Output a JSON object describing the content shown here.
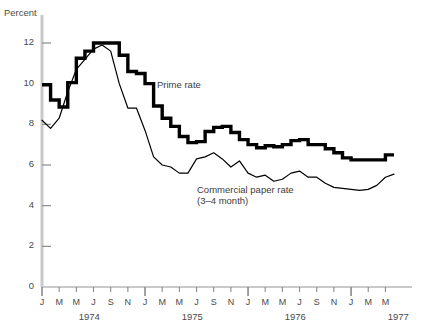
{
  "chart_data": {
    "type": "line",
    "title": "",
    "xlabel": "",
    "ylabel": "Percent",
    "ylim": [
      0,
      13
    ],
    "yticks": [
      0,
      2,
      4,
      6,
      8,
      10,
      12
    ],
    "grid": false,
    "legend_position": "inline-annotation",
    "x_start_year": 1974,
    "x_start_month": 1,
    "x_months_total": 42,
    "years": [
      "1974",
      "1975",
      "1976",
      "1977"
    ],
    "month_tick_labels": [
      "J",
      "M",
      "M",
      "J",
      "S",
      "N"
    ],
    "xtick_step_months": 2,
    "annotations": [
      {
        "name": "prime-rate-label",
        "text": "Prime rate"
      },
      {
        "name": "commercial-paper-label",
        "text": "Commercial paper rate\n(3–4 month)"
      }
    ],
    "series": [
      {
        "name": "Prime rate",
        "style": "step-thick",
        "color": "#000000",
        "values": [
          9.95,
          9.2,
          8.85,
          10.05,
          11.25,
          11.6,
          12.0,
          12.0,
          12.0,
          11.4,
          10.6,
          10.5,
          10.0,
          8.9,
          8.3,
          7.9,
          7.4,
          7.1,
          7.15,
          7.65,
          7.85,
          7.9,
          7.6,
          7.25,
          7.0,
          6.85,
          6.95,
          6.9,
          7.0,
          7.2,
          7.25,
          7.0,
          7.0,
          6.8,
          6.6,
          6.35,
          6.25,
          6.25,
          6.25,
          6.25,
          6.5,
          6.5
        ]
      },
      {
        "name": "Commercial paper rate (3-4 month)",
        "style": "line-thin",
        "color": "#000000",
        "values": [
          8.2,
          7.8,
          8.3,
          9.6,
          10.7,
          11.2,
          11.7,
          11.9,
          11.6,
          10.0,
          8.8,
          8.8,
          7.7,
          6.4,
          6.0,
          5.9,
          5.6,
          5.6,
          6.3,
          6.4,
          6.6,
          6.3,
          5.9,
          6.2,
          5.6,
          5.4,
          5.5,
          5.2,
          5.3,
          5.6,
          5.7,
          5.4,
          5.4,
          5.1,
          4.9,
          4.85,
          4.8,
          4.75,
          4.8,
          5.0,
          5.4,
          5.55
        ]
      }
    ]
  },
  "axis": {
    "y_axis_title": "Percent"
  }
}
